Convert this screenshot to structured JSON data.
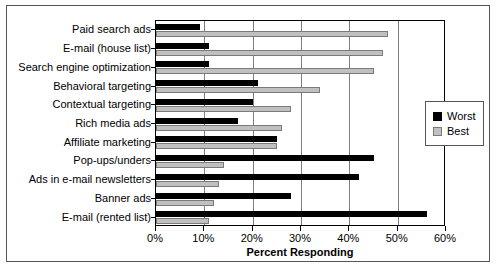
{
  "chart_data": {
    "type": "bar",
    "orientation": "horizontal",
    "title": "",
    "xlabel": "Percent Responding",
    "ylabel": "",
    "xlim": [
      0,
      60
    ],
    "xtick_labels": [
      "0%",
      "10%",
      "20%",
      "30%",
      "40%",
      "50%",
      "60%"
    ],
    "xtick_values": [
      0,
      10,
      20,
      30,
      40,
      50,
      60
    ],
    "grid": true,
    "grid_axis": "x",
    "legend_position": "right-outside",
    "categories": [
      "Paid search ads",
      "E-mail (house list)",
      "Search engine optimization",
      "Behavioral targeting",
      "Contextual targeting",
      "Rich media ads",
      "Affiliate marketing",
      "Pop-ups/unders",
      "Ads in e-mail newsletters",
      "Banner ads",
      "E-mail (rented list)"
    ],
    "series": [
      {
        "name": "Worst",
        "color": "#000000",
        "values": [
          9,
          11,
          11,
          21,
          20,
          17,
          25,
          45,
          42,
          28,
          56
        ]
      },
      {
        "name": "Best",
        "color": "#c0c0c0",
        "values": [
          48,
          47,
          45,
          34,
          28,
          26,
          25,
          14,
          13,
          12,
          11
        ]
      }
    ]
  },
  "legend": {
    "items": [
      {
        "label": "Worst",
        "swatch": "black-square-swatch"
      },
      {
        "label": "Best",
        "swatch": "gray-square-swatch"
      }
    ]
  }
}
